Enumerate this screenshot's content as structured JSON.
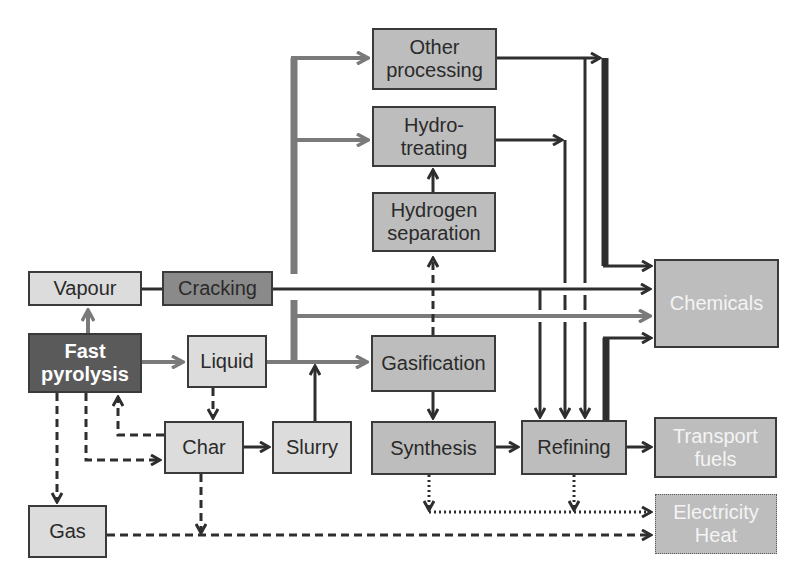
{
  "diagram": {
    "nodes": {
      "other_processing": {
        "label": "Other\nprocessing"
      },
      "hydrotreating": {
        "label": "Hydro-\ntreating"
      },
      "hydrogen_separation": {
        "label": "Hydrogen\nseparation"
      },
      "vapour": {
        "label": "Vapour"
      },
      "cracking": {
        "label": "Cracking"
      },
      "chemicals": {
        "label": "Chemicals"
      },
      "fast_pyrolysis": {
        "label": "Fast\npyrolysis"
      },
      "liquid": {
        "label": "Liquid"
      },
      "gasification": {
        "label": "Gasification"
      },
      "char": {
        "label": "Char"
      },
      "slurry": {
        "label": "Slurry"
      },
      "synthesis": {
        "label": "Synthesis"
      },
      "refining": {
        "label": "Refining"
      },
      "transport_fuels": {
        "label": "Transport\nfuels"
      },
      "gas": {
        "label": "Gas"
      },
      "electricity_heat": {
        "label": "Electricity\nHeat"
      }
    },
    "colors": {
      "line_dark": "#2e2e2e",
      "line_grey": "#7a7a7a",
      "box_light": "#dcdcdc",
      "box_mid": "#bdbdbd",
      "box_dark": "#8a8a8a",
      "box_darkest": "#5a5a5a"
    },
    "edges": [
      {
        "from": "fast_pyrolysis",
        "to": "vapour",
        "style": "grey-solid"
      },
      {
        "from": "fast_pyrolysis",
        "to": "liquid",
        "style": "grey-solid"
      },
      {
        "from": "fast_pyrolysis",
        "to": "gas",
        "style": "dashed"
      },
      {
        "from": "fast_pyrolysis",
        "to": "char",
        "style": "dashed"
      },
      {
        "from": "char",
        "to": "fast_pyrolysis",
        "style": "dashed"
      },
      {
        "from": "liquid",
        "to": "char",
        "style": "dashed"
      },
      {
        "from": "char",
        "to": "slurry",
        "style": "solid"
      },
      {
        "from": "char",
        "to": "electricity_heat",
        "style": "dashed"
      },
      {
        "from": "slurry",
        "to": "gasification",
        "style": "solid"
      },
      {
        "from": "vapour",
        "to": "cracking",
        "style": "solid"
      },
      {
        "from": "cracking",
        "to": "chemicals",
        "style": "solid"
      },
      {
        "from": "liquid",
        "to": "other_processing",
        "style": "grey-solid"
      },
      {
        "from": "liquid",
        "to": "hydrotreating",
        "style": "grey-solid"
      },
      {
        "from": "liquid",
        "to": "chemicals",
        "style": "grey-solid"
      },
      {
        "from": "liquid",
        "to": "gasification",
        "style": "grey-solid"
      },
      {
        "from": "gasification",
        "to": "hydrogen_separation",
        "style": "dashed"
      },
      {
        "from": "hydrogen_separation",
        "to": "hydrotreating",
        "style": "solid"
      },
      {
        "from": "gasification",
        "to": "synthesis",
        "style": "solid"
      },
      {
        "from": "synthesis",
        "to": "refining",
        "style": "solid"
      },
      {
        "from": "other_processing",
        "to": "chemicals",
        "style": "thick"
      },
      {
        "from": "other_processing",
        "to": "refining",
        "style": "solid"
      },
      {
        "from": "hydrotreating",
        "to": "refining",
        "style": "solid"
      },
      {
        "from": "cracking",
        "to": "refining",
        "style": "solid"
      },
      {
        "from": "refining",
        "to": "chemicals",
        "style": "thick"
      },
      {
        "from": "refining",
        "to": "transport_fuels",
        "style": "solid"
      },
      {
        "from": "synthesis",
        "to": "electricity_heat",
        "style": "dotted"
      },
      {
        "from": "refining",
        "to": "electricity_heat",
        "style": "dotted"
      },
      {
        "from": "gas",
        "to": "electricity_heat",
        "style": "dashed"
      }
    ]
  }
}
